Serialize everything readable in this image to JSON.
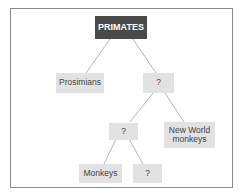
{
  "diagram": {
    "type": "tree",
    "colors": {
      "root_fill": "#4a4a4a",
      "node_fill": "#e2e2e2",
      "line": "#b5b5b5",
      "frame": "#8a8a8a"
    },
    "nodes": {
      "root": "PRIMATES",
      "prosimians": "Prosimians",
      "unknown_l1": "?",
      "unknown_l2": "?",
      "new_world": "New World monkeys",
      "monkeys": "Monkeys",
      "unknown_l3": "?"
    },
    "edges": [
      [
        "root",
        "prosimians"
      ],
      [
        "root",
        "unknown_l1"
      ],
      [
        "unknown_l1",
        "unknown_l2"
      ],
      [
        "unknown_l1",
        "new_world"
      ],
      [
        "unknown_l2",
        "monkeys"
      ],
      [
        "unknown_l2",
        "unknown_l3"
      ]
    ]
  }
}
